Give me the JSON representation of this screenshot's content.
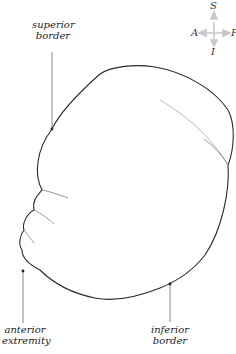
{
  "compass": {
    "superior": "S",
    "inferior": "I",
    "anterior": "A",
    "posterior": "P",
    "arrow_color": "#c8c8c8"
  },
  "labels": {
    "superior_border": [
      "superior",
      "border"
    ],
    "anterior_extremity": [
      "anterior",
      "extremity"
    ],
    "inferior_border": [
      "inferior",
      "border"
    ]
  },
  "colors": {
    "outline": "#2a2a2a",
    "leader": "#555555",
    "faint_line": "#b0b0b0"
  }
}
